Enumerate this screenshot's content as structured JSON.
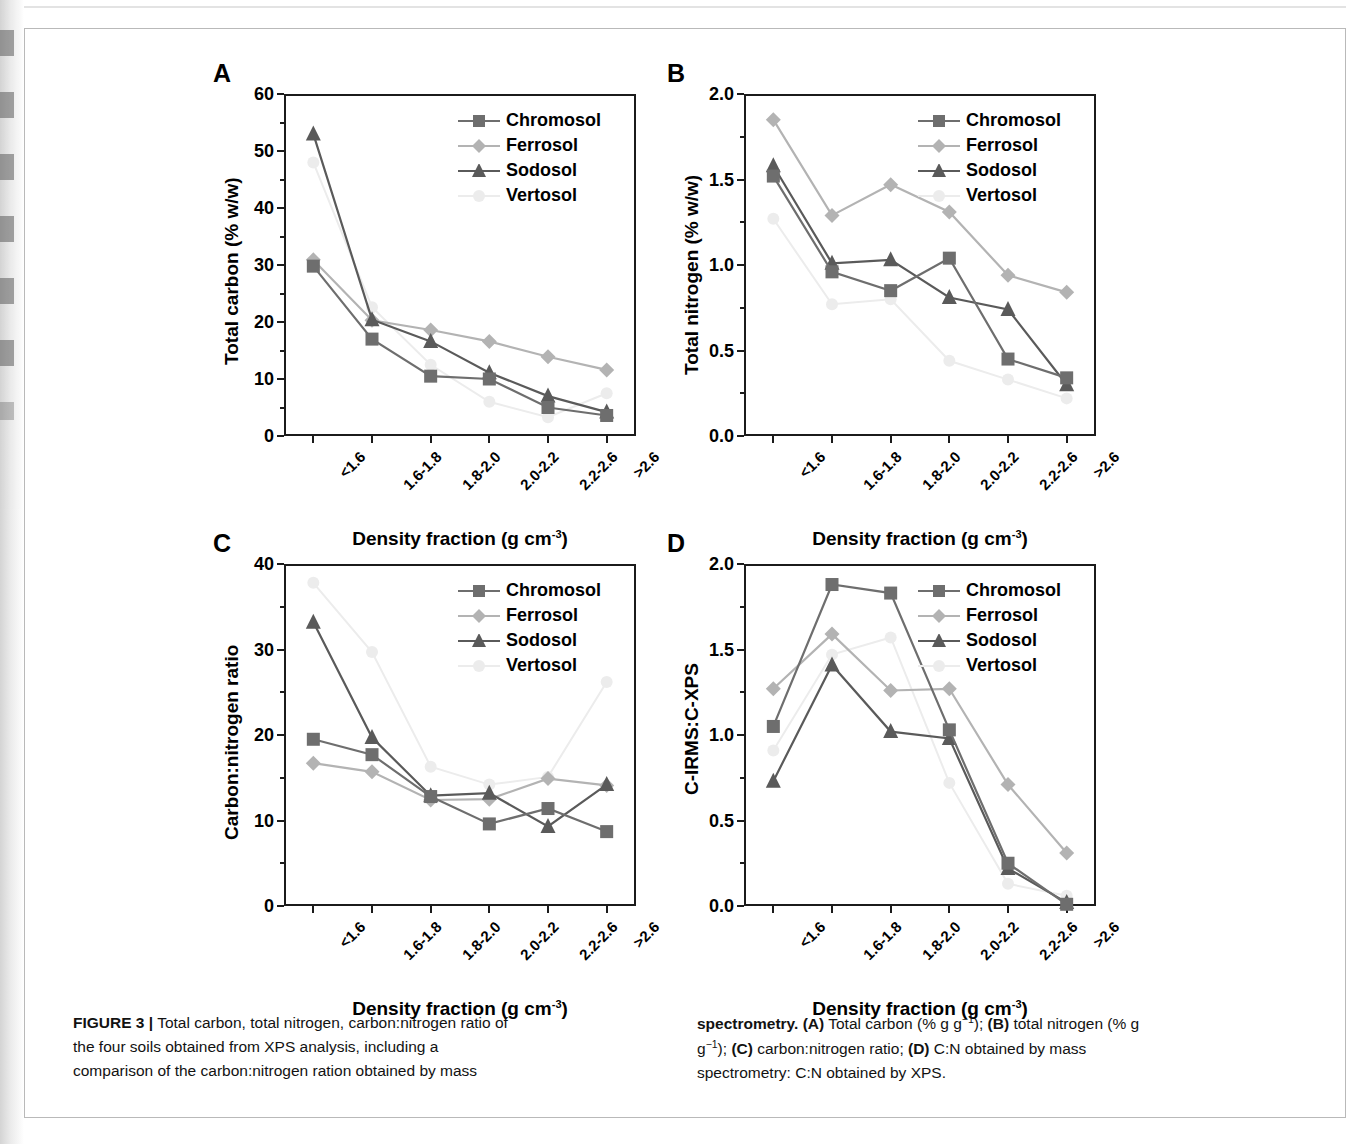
{
  "figure": {
    "panel_letters": [
      "A",
      "B",
      "C",
      "D"
    ],
    "caption_left": [
      "FIGURE 3 | Total carbon, total nitrogen, carbon:nitrogen ratio of",
      "the four soils obtained from XPS analysis, including a",
      "comparison of the carbon:nitrogen ration obtained by mass"
    ],
    "caption_right": [
      "spectrometry. (A) Total carbon (% g g−1); (B) total nitrogen (% g",
      "g−1); (C) carbon:nitrogen ratio; (D) C:N obtained by mass",
      "spectrometry: C:N obtained by XPS."
    ],
    "caption_bold_lead_left": "FIGURE 3 |",
    "caption_bold_lead_right": "spectrometry."
  },
  "colors": {
    "chromosol": "#6e6e6e",
    "ferrosol": "#b3b3b3",
    "sodosol": "#5a5a5a",
    "vertosol": "#ececec",
    "axis": "#1b1b1b",
    "text": "#000000"
  },
  "legend": {
    "entries": [
      {
        "label": "Chromosol",
        "marker": "square",
        "color_key": "chromosol"
      },
      {
        "label": "Ferrosol",
        "marker": "diamond",
        "color_key": "ferrosol"
      },
      {
        "label": "Sodosol",
        "marker": "triangle",
        "color_key": "sodosol"
      },
      {
        "label": "Vertosol",
        "marker": "circle",
        "color_key": "vertosol"
      }
    ]
  },
  "chart_data": [
    {
      "panel": "A",
      "type": "line",
      "title": "",
      "xlabel": "Density fraction (g cm-3)",
      "xlabel_base": "Density fraction (g cm",
      "xlabel_sup": "-3",
      "xlabel_tail": ")",
      "ylabel": "Total carbon (% w/w)",
      "categories": [
        "<1.6",
        "1.6-1.8",
        "1.8-2.0",
        "2.0-2.2",
        "2.2-2.6",
        ">2.6"
      ],
      "ylim": [
        0,
        60
      ],
      "yticks": [
        0,
        10,
        20,
        30,
        40,
        50,
        60
      ],
      "ytick_labels": [
        "0",
        "10",
        "20",
        "30",
        "40",
        "50",
        "60"
      ],
      "grid": false,
      "legend_position": "top-right",
      "series": [
        {
          "name": "Chromosol",
          "values": [
            29.8,
            17.0,
            10.5,
            10.0,
            5.0,
            3.6
          ]
        },
        {
          "name": "Ferrosol",
          "values": [
            30.9,
            20.3,
            18.6,
            16.6,
            13.9,
            11.6
          ]
        },
        {
          "name": "Sodosol",
          "values": [
            53.0,
            20.4,
            16.6,
            11.1,
            7.0,
            4.2
          ]
        },
        {
          "name": "Vertosol",
          "values": [
            48.0,
            22.6,
            12.5,
            6.0,
            3.3,
            7.5
          ]
        }
      ]
    },
    {
      "panel": "B",
      "type": "line",
      "title": "",
      "xlabel": "Density fraction (g cm-3)",
      "xlabel_base": "Density fraction (g cm",
      "xlabel_sup": "-3",
      "xlabel_tail": ")",
      "ylabel": "Total nitrogen (% w/w)",
      "categories": [
        "<1.6",
        "1.6-1.8",
        "1.8-2.0",
        "2.0-2.2",
        "2.2-2.6",
        ">2.6"
      ],
      "ylim": [
        0.0,
        2.0
      ],
      "yticks": [
        0.0,
        0.5,
        1.0,
        1.5,
        2.0
      ],
      "ytick_labels": [
        "0.0",
        "0.5",
        "1.0",
        "1.5",
        "2.0"
      ],
      "grid": false,
      "legend_position": "top-right",
      "series": [
        {
          "name": "Chromosol",
          "values": [
            1.52,
            0.96,
            0.85,
            1.04,
            0.45,
            0.34
          ]
        },
        {
          "name": "Ferrosol",
          "values": [
            1.85,
            1.29,
            1.47,
            1.31,
            0.94,
            0.84
          ]
        },
        {
          "name": "Sodosol",
          "values": [
            1.58,
            1.01,
            1.03,
            0.81,
            0.74,
            0.3
          ]
        },
        {
          "name": "Vertosol",
          "values": [
            1.27,
            0.77,
            0.8,
            0.44,
            0.33,
            0.22
          ]
        }
      ]
    },
    {
      "panel": "C",
      "type": "line",
      "title": "",
      "xlabel": "Density fraction (g cm-3)",
      "xlabel_base": "Density fraction (g cm",
      "xlabel_sup": "-3",
      "xlabel_tail": ")",
      "ylabel": "Carbon:nitrogen ratio",
      "categories": [
        "<1.6",
        "1.6-1.8",
        "1.8-2.0",
        "2.0-2.2",
        "2.2-2.6",
        ">2.6"
      ],
      "ylim": [
        0,
        40
      ],
      "yticks": [
        0,
        10,
        20,
        30,
        40
      ],
      "ytick_labels": [
        "0",
        "10",
        "20",
        "30",
        "40"
      ],
      "grid": false,
      "legend_position": "top-right",
      "series": [
        {
          "name": "Chromosol",
          "values": [
            19.5,
            17.7,
            12.8,
            9.6,
            11.4,
            8.7
          ]
        },
        {
          "name": "Ferrosol",
          "values": [
            16.7,
            15.7,
            12.4,
            12.5,
            14.9,
            14.1
          ]
        },
        {
          "name": "Sodosol",
          "values": [
            33.2,
            19.7,
            12.9,
            13.2,
            9.3,
            14.2
          ]
        },
        {
          "name": "Vertosol",
          "values": [
            37.8,
            29.7,
            16.3,
            14.2,
            15.1,
            26.2
          ]
        }
      ]
    },
    {
      "panel": "D",
      "type": "line",
      "title": "",
      "xlabel": "Density fraction (g cm-3)",
      "xlabel_base": "Density fraction (g cm",
      "xlabel_sup": "-3",
      "xlabel_tail": ")",
      "ylabel": "C-IRMS:C-XPS",
      "categories": [
        "<1.6",
        "1.6-1.8",
        "1.8-2.0",
        "2.0-2.2",
        "2.2-2.6",
        ">2.6"
      ],
      "ylim": [
        0.0,
        2.0
      ],
      "yticks": [
        0.0,
        0.5,
        1.0,
        1.5,
        2.0
      ],
      "ytick_labels": [
        "0.0",
        "0.5",
        "1.0",
        "1.5",
        "2.0"
      ],
      "grid": false,
      "legend_position": "top-right",
      "series": [
        {
          "name": "Chromosol",
          "values": [
            1.05,
            1.88,
            1.83,
            1.03,
            0.25,
            0.01
          ]
        },
        {
          "name": "Ferrosol",
          "values": [
            1.27,
            1.59,
            1.26,
            1.27,
            0.71,
            0.31
          ]
        },
        {
          "name": "Sodosol",
          "values": [
            0.73,
            1.41,
            1.02,
            0.98,
            0.22,
            0.02
          ]
        },
        {
          "name": "Vertosol",
          "values": [
            0.91,
            1.47,
            1.57,
            0.72,
            0.13,
            0.06
          ]
        }
      ]
    }
  ]
}
